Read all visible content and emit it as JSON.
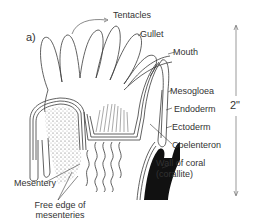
{
  "figure": {
    "panel_letter": "a)",
    "scale": {
      "label": "2\""
    },
    "labels": {
      "tentacles": "Tentacles",
      "gullet": "Gullet",
      "mouth": "Mouth",
      "mesogloea": "Mesogloea",
      "endoderm": "Endoderm",
      "ectoderm": "Ectoderm",
      "coelenteron": "Coelenteron",
      "wall_line1": "Wall of coral",
      "wall_line2": "(corallite)",
      "mesentery": "Mesentery",
      "free_edge_line1": "Free edge of",
      "free_edge_line2": "mesenteries"
    },
    "colors": {
      "line": "#3a3a3a",
      "fill_black": "#111111",
      "background": "#ffffff"
    }
  }
}
